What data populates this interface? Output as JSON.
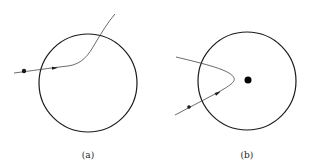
{
  "colors": {
    "stroke": "#1a1a1a",
    "path": "#444444",
    "background": "#ffffff"
  },
  "panels": [
    {
      "id": "a",
      "label": "(a)",
      "circle": {
        "cx": 88,
        "cy": 83,
        "r": 49
      },
      "particle_dot": {
        "cx": 24,
        "cy": 71,
        "r": 2.2
      },
      "center_dot": null,
      "trajectory": "M14,73 C30,71 50,68 68,66 C82,64 88,56 96,42 C102,32 108,22 115,14",
      "arrow": {
        "x": 55,
        "y": 68,
        "angle": -5
      }
    },
    {
      "id": "b",
      "label": "(b)",
      "circle": {
        "cx": 247,
        "cy": 81,
        "r": 49
      },
      "particle_dot": {
        "cx": 189,
        "cy": 107,
        "r": 1.8
      },
      "center_dot": {
        "cx": 248,
        "cy": 80,
        "r": 3.5
      },
      "trajectory": "M175,115 L213,95 C228,87 236,82 234,78 C231,70 205,64 176,57",
      "arrow": {
        "x": 218,
        "y": 93,
        "angle": -28
      }
    }
  ]
}
